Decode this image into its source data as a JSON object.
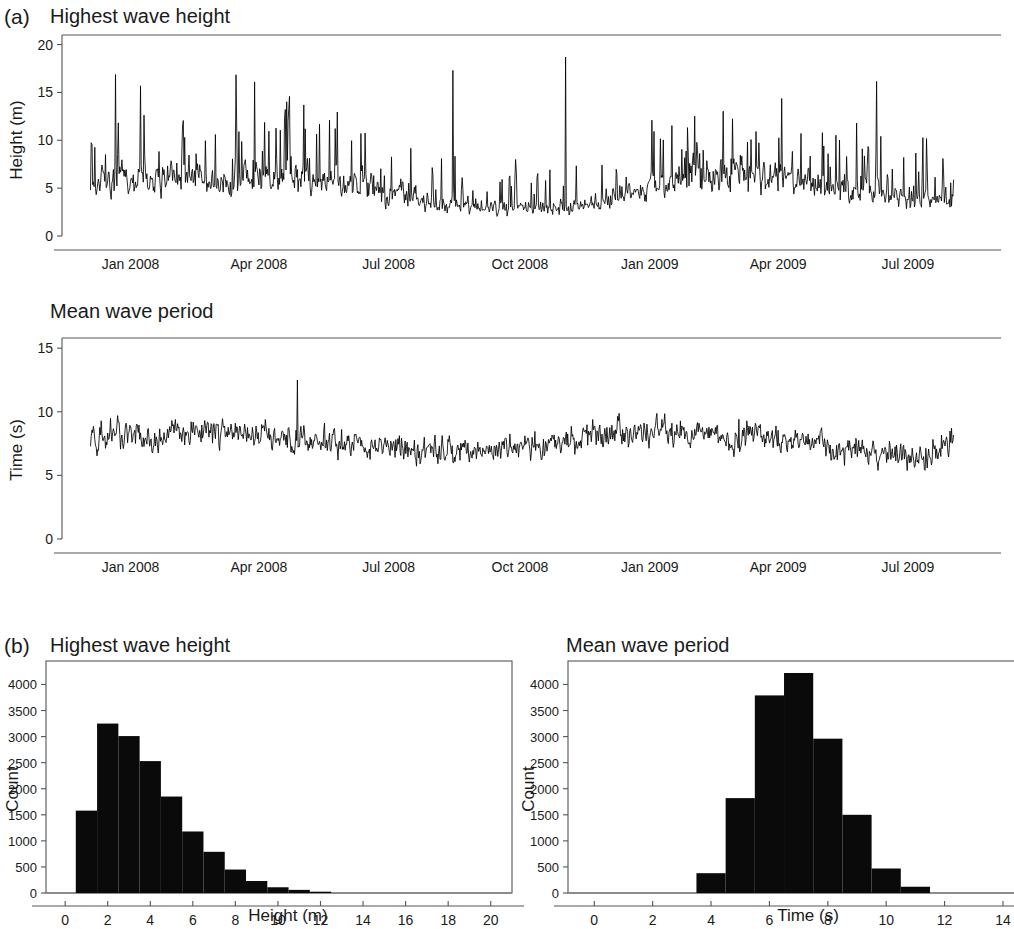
{
  "figure": {
    "background": "#ffffff",
    "ink": "#000000",
    "panels": [
      {
        "label": "(a)",
        "charts": [
          "timeseries_height",
          "timeseries_period"
        ]
      },
      {
        "label": "(b)",
        "charts": [
          "hist_height",
          "hist_period"
        ]
      }
    ]
  },
  "chart_data": [
    {
      "id": "timeseries_height",
      "type": "line",
      "title": "Highest wave height",
      "panel": "(a)",
      "xlabel": "",
      "ylabel": "Height (m)",
      "ylim": [
        0,
        21
      ],
      "yticks": [
        0,
        5,
        10,
        15,
        20
      ],
      "ytick_labels": [
        "0",
        "5",
        "10",
        "15",
        "20"
      ],
      "xlim": [
        0,
        640
      ],
      "xticks": [
        48,
        138,
        229,
        321,
        412,
        502,
        593
      ],
      "xtick_labels": [
        "Jan 2008",
        "Apr 2008",
        "Jul 2008",
        "Oct 2008",
        "Jan 2009",
        "Apr 2009",
        "Jul 2009"
      ],
      "grid": false,
      "legend": null,
      "data_start_index": 20,
      "data_end_index": 625,
      "units": "m",
      "sampling": "daily maxima over ~21 months",
      "notes": "Black jagged trace; winter storm peaks up to ~18.7 m in Nov 2008; calm summer minimum near 1 m Jun-Aug 2008.",
      "y_extremes": {
        "max": 18.7,
        "max_label": "Nov 2008",
        "min": 0.9,
        "min_label": "Jul 2008"
      },
      "seed": 11,
      "baseline_profile": [
        {
          "x": 20,
          "y": 5.4
        },
        {
          "x": 40,
          "y": 6.0
        },
        {
          "x": 60,
          "y": 5.6
        },
        {
          "x": 85,
          "y": 6.2
        },
        {
          "x": 110,
          "y": 5.8
        },
        {
          "x": 135,
          "y": 6.1
        },
        {
          "x": 160,
          "y": 6.4
        },
        {
          "x": 185,
          "y": 5.9
        },
        {
          "x": 210,
          "y": 5.3
        },
        {
          "x": 235,
          "y": 4.3
        },
        {
          "x": 258,
          "y": 3.5
        },
        {
          "x": 280,
          "y": 3.1
        },
        {
          "x": 300,
          "y": 3.0
        },
        {
          "x": 320,
          "y": 3.0
        },
        {
          "x": 340,
          "y": 2.9
        },
        {
          "x": 360,
          "y": 3.1
        },
        {
          "x": 380,
          "y": 3.6
        },
        {
          "x": 400,
          "y": 4.4
        },
        {
          "x": 420,
          "y": 5.2
        },
        {
          "x": 440,
          "y": 6.0
        },
        {
          "x": 460,
          "y": 6.4
        },
        {
          "x": 480,
          "y": 6.2
        },
        {
          "x": 500,
          "y": 6.0
        },
        {
          "x": 520,
          "y": 5.6
        },
        {
          "x": 545,
          "y": 5.2
        },
        {
          "x": 565,
          "y": 4.6
        },
        {
          "x": 585,
          "y": 4.0
        },
        {
          "x": 605,
          "y": 3.6
        },
        {
          "x": 625,
          "y": 4.4
        }
      ],
      "spike_density": 0.17,
      "spike_scale": 2.1
    },
    {
      "id": "timeseries_period",
      "type": "line",
      "title": "Mean wave period",
      "panel": "(a)",
      "xlabel": "",
      "ylabel": "Time (s)",
      "ylim": [
        0,
        15.8
      ],
      "yticks": [
        0,
        5,
        10,
        15
      ],
      "ytick_labels": [
        "0",
        "5",
        "10",
        "15"
      ],
      "xlim": [
        0,
        640
      ],
      "xticks": [
        48,
        138,
        229,
        321,
        412,
        502,
        593
      ],
      "xtick_labels": [
        "Jan 2008",
        "Apr 2008",
        "Jul 2008",
        "Oct 2008",
        "Jan 2009",
        "Apr 2009",
        "Jul 2009"
      ],
      "grid": false,
      "legend": null,
      "data_start_index": 20,
      "data_end_index": 625,
      "units": "s",
      "notes": "Dense band oscillating about 7-8 s; isolated spike ~12.5 s in Mar 2008; lowest values ~3.8 s in Jul 2009.",
      "y_extremes": {
        "max": 12.5,
        "max_label": "Mar 2008",
        "min": 3.8,
        "min_label": "Jul 2009"
      },
      "seed": 29,
      "baseline_profile": [
        {
          "x": 20,
          "y": 8.0
        },
        {
          "x": 45,
          "y": 8.2
        },
        {
          "x": 70,
          "y": 7.9
        },
        {
          "x": 95,
          "y": 8.4
        },
        {
          "x": 120,
          "y": 8.3
        },
        {
          "x": 145,
          "y": 8.1
        },
        {
          "x": 170,
          "y": 7.8
        },
        {
          "x": 195,
          "y": 7.6
        },
        {
          "x": 220,
          "y": 7.3
        },
        {
          "x": 245,
          "y": 7.0
        },
        {
          "x": 270,
          "y": 6.9
        },
        {
          "x": 295,
          "y": 7.0
        },
        {
          "x": 320,
          "y": 7.2
        },
        {
          "x": 345,
          "y": 7.6
        },
        {
          "x": 370,
          "y": 8.0
        },
        {
          "x": 395,
          "y": 8.3
        },
        {
          "x": 420,
          "y": 8.4
        },
        {
          "x": 445,
          "y": 8.2
        },
        {
          "x": 470,
          "y": 8.0
        },
        {
          "x": 495,
          "y": 7.8
        },
        {
          "x": 520,
          "y": 7.5
        },
        {
          "x": 545,
          "y": 7.0
        },
        {
          "x": 570,
          "y": 6.6
        },
        {
          "x": 595,
          "y": 6.5
        },
        {
          "x": 625,
          "y": 7.4
        }
      ],
      "noise_scale": 1.15,
      "spike_density": 0.04,
      "spike_scale": 1.6
    },
    {
      "id": "hist_height",
      "type": "bar",
      "title": "Highest wave height",
      "panel": "(b)",
      "xlabel": "Height (m)",
      "ylabel": "Count",
      "xlim": [
        -0.9,
        21.0
      ],
      "ylim": [
        0,
        4450
      ],
      "xticks": [
        0,
        2,
        4,
        6,
        8,
        10,
        12,
        14,
        16,
        18,
        20
      ],
      "xtick_labels": [
        "0",
        "2",
        "4",
        "6",
        "8",
        "10",
        "12",
        "14",
        "16",
        "18",
        "20"
      ],
      "yticks": [
        0,
        500,
        1000,
        1500,
        2000,
        2500,
        3000,
        3500,
        4000
      ],
      "ytick_labels": [
        "0",
        "500",
        "1000",
        "1500",
        "2000",
        "2500",
        "3000",
        "3500",
        "4000"
      ],
      "grid": false,
      "legend": null,
      "bin_width": 1,
      "bin_edges": [
        0.5,
        1.5,
        2.5,
        3.5,
        4.5,
        5.5,
        6.5,
        7.5,
        8.5,
        9.5,
        10.5,
        11.5,
        12.5
      ],
      "categories": [
        "0.5-1.5",
        "1.5-2.5",
        "2.5-3.5",
        "3.5-4.5",
        "4.5-5.5",
        "5.5-6.5",
        "6.5-7.5",
        "7.5-8.5",
        "8.5-9.5",
        "9.5-10.5",
        "10.5-11.5",
        "11.5-12.5"
      ],
      "values": [
        1580,
        3250,
        3010,
        2530,
        1850,
        1180,
        790,
        450,
        230,
        110,
        60,
        25
      ],
      "bar_color": "#0a0a0a"
    },
    {
      "id": "hist_period",
      "type": "bar",
      "title": "Mean wave period",
      "panel": "(b)",
      "xlabel": "Time (s)",
      "ylabel": "Count",
      "xlim": [
        -0.9,
        15.2
      ],
      "ylim": [
        0,
        4450
      ],
      "xticks": [
        0,
        2,
        4,
        6,
        8,
        10,
        12,
        14
      ],
      "xtick_labels": [
        "0",
        "2",
        "4",
        "6",
        "8",
        "10",
        "12",
        "14"
      ],
      "yticks": [
        0,
        500,
        1000,
        1500,
        2000,
        2500,
        3000,
        3500,
        4000
      ],
      "ytick_labels": [
        "0",
        "500",
        "1000",
        "1500",
        "2000",
        "2500",
        "3000",
        "3500",
        "4000"
      ],
      "grid": false,
      "legend": null,
      "bin_width": 1,
      "bin_edges": [
        3.5,
        4.5,
        5.5,
        6.5,
        7.5,
        8.5,
        9.5,
        10.5,
        11.5
      ],
      "categories": [
        "3.5-4.5",
        "4.5-5.5",
        "5.5-6.5",
        "6.5-7.5",
        "7.5-8.5",
        "8.5-9.5",
        "9.5-10.5",
        "10.5-11.5"
      ],
      "values": [
        380,
        1820,
        3790,
        4220,
        2960,
        1500,
        470,
        120
      ],
      "bar_color": "#0a0a0a"
    }
  ]
}
